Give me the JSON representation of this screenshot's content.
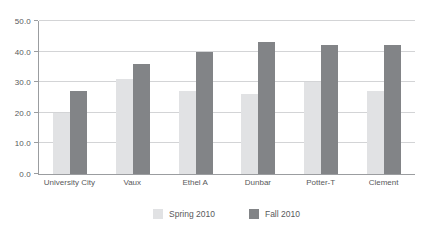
{
  "chart_data": {
    "type": "bar",
    "categories": [
      "University City",
      "Vaux",
      "Ethel A",
      "Dunbar",
      "Potter-T",
      "Clement"
    ],
    "series": [
      {
        "name": "Spring 2010",
        "color": "#e1e2e4",
        "values": [
          20,
          31,
          27,
          26,
          30,
          27
        ]
      },
      {
        "name": "Fall 2010",
        "color": "#828487",
        "values": [
          27,
          36,
          40,
          43,
          42,
          42
        ]
      }
    ],
    "title": "",
    "xlabel": "",
    "ylabel": "",
    "ylim": [
      0,
      50
    ],
    "ytick_step": 10,
    "ytick_labels": [
      "0.0",
      "10.0",
      "20.0",
      "30.0",
      "40.0",
      "50.0"
    ],
    "grid": true,
    "legend_position": "bottom-center",
    "colors": {
      "background": "#ffffff",
      "gridline": "#d3d4d6",
      "axis": "#9b9da0",
      "text": "#58595b"
    }
  }
}
